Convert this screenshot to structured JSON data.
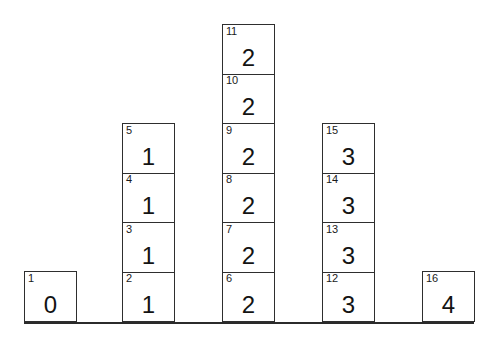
{
  "figure": {
    "type": "dot-plot-blocks",
    "background_color": "#ffffff",
    "line_color": "#2e2e2e",
    "text_color": "#131313",
    "width": 496,
    "height": 339
  },
  "axis": {
    "baseline_label": "baseline",
    "x_start": 24,
    "x_end": 474,
    "y": 322,
    "thickness": 2
  },
  "layout": {
    "block_width": 53,
    "block_height": 51,
    "baseline_y": 322,
    "column_x": [
      24,
      122,
      222,
      322,
      422
    ]
  },
  "chart_data": {
    "type": "bar",
    "title": "",
    "xlabel": "",
    "ylabel": "",
    "categories": [
      "0",
      "1",
      "2",
      "3",
      "4"
    ],
    "values": [
      1,
      4,
      6,
      4,
      1
    ],
    "ylim": [
      0,
      6
    ],
    "grid": false,
    "legend": null,
    "note": "Stacked unit blocks; each block is labelled with its sequential observation index (small, upper-left) and the data value it represents (large, centred).",
    "observations": [
      {
        "index": "1",
        "value": "0"
      },
      {
        "index": "2",
        "value": "1"
      },
      {
        "index": "3",
        "value": "1"
      },
      {
        "index": "4",
        "value": "1"
      },
      {
        "index": "5",
        "value": "1"
      },
      {
        "index": "6",
        "value": "2"
      },
      {
        "index": "7",
        "value": "2"
      },
      {
        "index": "8",
        "value": "2"
      },
      {
        "index": "9",
        "value": "2"
      },
      {
        "index": "10",
        "value": "2"
      },
      {
        "index": "11",
        "value": "2"
      },
      {
        "index": "12",
        "value": "3"
      },
      {
        "index": "13",
        "value": "3"
      },
      {
        "index": "14",
        "value": "3"
      },
      {
        "index": "15",
        "value": "3"
      },
      {
        "index": "16",
        "value": "4"
      }
    ]
  },
  "columns": [
    {
      "category": "0",
      "count": 1,
      "blocks": [
        {
          "index": "1",
          "value": "0"
        }
      ]
    },
    {
      "category": "1",
      "count": 4,
      "blocks": [
        {
          "index": "2",
          "value": "1"
        },
        {
          "index": "3",
          "value": "1"
        },
        {
          "index": "4",
          "value": "1"
        },
        {
          "index": "5",
          "value": "1"
        }
      ]
    },
    {
      "category": "2",
      "count": 6,
      "blocks": [
        {
          "index": "6",
          "value": "2"
        },
        {
          "index": "7",
          "value": "2"
        },
        {
          "index": "8",
          "value": "2"
        },
        {
          "index": "9",
          "value": "2"
        },
        {
          "index": "10",
          "value": "2"
        },
        {
          "index": "11",
          "value": "2"
        }
      ]
    },
    {
      "category": "3",
      "count": 4,
      "blocks": [
        {
          "index": "12",
          "value": "3"
        },
        {
          "index": "13",
          "value": "3"
        },
        {
          "index": "14",
          "value": "3"
        },
        {
          "index": "15",
          "value": "3"
        }
      ]
    },
    {
      "category": "4",
      "count": 1,
      "blocks": [
        {
          "index": "16",
          "value": "4"
        }
      ]
    }
  ]
}
